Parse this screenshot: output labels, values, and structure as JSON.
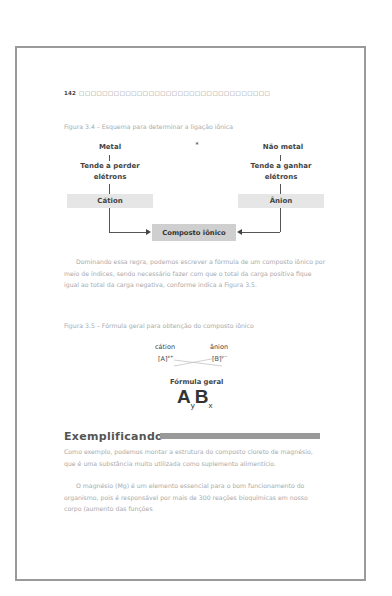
{
  "page": {
    "page_number": "142",
    "header_boxes": "□□□□□□□□□□□□□□□□□□□□□□□□□□□□□□□□□"
  },
  "figure_3_4": {
    "caption": "Figura 3.4 – Esquema para determinar a ligação iônica",
    "asterisk": "*",
    "left": {
      "title": "Metal",
      "bar": "|",
      "line1": "Tende a perder",
      "line2": "elétrons",
      "result": "Cátion"
    },
    "right": {
      "title": "Não metal",
      "bar": "|",
      "line1": "Tende a ganhar",
      "line2": "elétrons",
      "result": "Ânion"
    },
    "center": "Composto iônico"
  },
  "paragraph1": "Dominando essa regra, podemos escrever a fórmula de um composto iônico por meio de índices, sendo necessário fazer com que o total da carga positiva fique igual ao total da carga negativa, conforme indica a Figura 3.5.",
  "figure_3_5": {
    "caption": "Figura 3.5 – Fórmula geral para obtenção do composto iônico",
    "cation_label": "cátion",
    "anion_label": "ânion",
    "cation_symbol": "[A]",
    "cation_charge": "x+",
    "anion_symbol": "[B]",
    "anion_charge": "y−",
    "general_label": "Fórmula geral",
    "formula_a": "A",
    "formula_sub_a": "y",
    "formula_b": "B",
    "formula_sub_b": "x"
  },
  "section": {
    "title": "Exemplificando",
    "para1": "Como exemplo, podemos montar a estrutura do composto cloreto de magnésio, que é uma substância muito utilizada como suplemento alimentício.",
    "para2": "O magnésio (Mg) é um elemento essencial para o bom funcionamento do organismo, pois é responsável por mais de 300 reações bioquímicas em nosso corpo (aumento das funções"
  }
}
